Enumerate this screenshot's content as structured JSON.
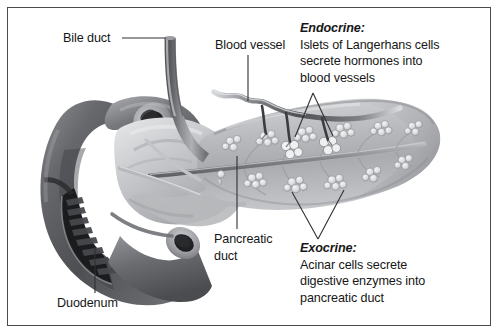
{
  "figure": {
    "border_color": "#4b4b4d",
    "background_color": "#ffffff",
    "text_color": "#161616"
  },
  "labels": {
    "bile_duct": "Bile duct",
    "blood_vessel": "Blood vessel",
    "pancreatic_duct_line1": "Pancreatic",
    "pancreatic_duct_line2": "duct",
    "duodenum": "Duodenum"
  },
  "callouts": {
    "endocrine": {
      "heading": "Endocrine:",
      "lines": [
        "Islets of Langerhans cells",
        "secrete hormones into",
        "blood vessels"
      ]
    },
    "exocrine": {
      "heading": "Exocrine:",
      "lines": [
        "Acinar cells secrete",
        "digestive enzymes into",
        "pancreatic duct"
      ]
    }
  }
}
